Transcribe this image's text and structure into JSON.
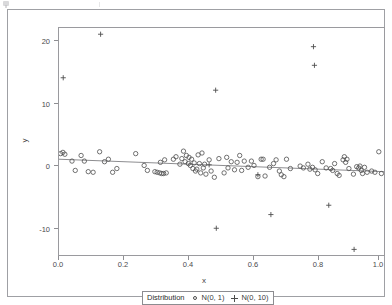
{
  "figure": {
    "background_color": "#ffffff",
    "border_color": "#9fa0a4",
    "marker_color": "#4d4d4d",
    "line_color": "#6f6f73"
  },
  "axis": {
    "x_label": "x",
    "y_label": "y",
    "x_ticks": [
      "0.0",
      "0.2",
      "0.4",
      "0.6",
      "0.8",
      "1.0"
    ],
    "y_ticks": [
      "20",
      "10",
      "0",
      "-10"
    ]
  },
  "legend": {
    "title": "Distribution",
    "entries": [
      {
        "symbol": "circle",
        "label": "N(0, 1)"
      },
      {
        "symbol": "plus",
        "label": "N(0, 10)"
      }
    ]
  },
  "chart_data": {
    "type": "scatter",
    "title": "",
    "subtitle": "",
    "xlabel": "x",
    "ylabel": "y",
    "xlim": [
      0.0,
      1.0
    ],
    "ylim": [
      -14.5,
      22.0
    ],
    "xticks": [
      0.0,
      0.2,
      0.4,
      0.6,
      0.8,
      1.0
    ],
    "yticks": [
      20,
      10,
      0,
      -10
    ],
    "grid": false,
    "legend_position": "bottom-center",
    "legend_title": "Distribution",
    "annotations": [],
    "series": [
      {
        "name": "N(0, 1)",
        "marker": "circle",
        "points": [
          [
            0.005,
            1.8
          ],
          [
            0.012,
            2.0
          ],
          [
            0.018,
            1.7
          ],
          [
            0.04,
            0.6
          ],
          [
            0.05,
            -0.9
          ],
          [
            0.068,
            1.5
          ],
          [
            0.078,
            0.6
          ],
          [
            0.09,
            -1.1
          ],
          [
            0.105,
            -1.2
          ],
          [
            0.125,
            2.1
          ],
          [
            0.14,
            0.5
          ],
          [
            0.152,
            0.9
          ],
          [
            0.165,
            -1.2
          ],
          [
            0.178,
            -0.6
          ],
          [
            0.236,
            1.8
          ],
          [
            0.262,
            -0.1
          ],
          [
            0.272,
            -0.9
          ],
          [
            0.295,
            -1.1
          ],
          [
            0.302,
            -1.2
          ],
          [
            0.31,
            -1.3
          ],
          [
            0.312,
            0.4
          ],
          [
            0.316,
            -1.4
          ],
          [
            0.322,
            -1.4
          ],
          [
            0.325,
            0.8
          ],
          [
            0.33,
            -1.3
          ],
          [
            0.352,
            0.9
          ],
          [
            0.36,
            1.3
          ],
          [
            0.372,
            0.1
          ],
          [
            0.378,
            1.0
          ],
          [
            0.383,
            2.2
          ],
          [
            0.388,
            0.5
          ],
          [
            0.392,
            1.5
          ],
          [
            0.398,
            0.2
          ],
          [
            0.4,
            1.2
          ],
          [
            0.404,
            -0.1
          ],
          [
            0.408,
            0.9
          ],
          [
            0.412,
            -0.6
          ],
          [
            0.416,
            0.3
          ],
          [
            0.42,
            -1.0
          ],
          [
            0.424,
            -0.7
          ],
          [
            0.428,
            1.6
          ],
          [
            0.432,
            0.2
          ],
          [
            0.436,
            -1.3
          ],
          [
            0.44,
            1.9
          ],
          [
            0.444,
            -0.5
          ],
          [
            0.448,
            0.1
          ],
          [
            0.452,
            -1.5
          ],
          [
            0.462,
            0.8
          ],
          [
            0.468,
            -1.0
          ],
          [
            0.478,
            -2.0
          ],
          [
            0.492,
            1.0
          ],
          [
            0.508,
            -1.3
          ],
          [
            0.516,
            1.2
          ],
          [
            0.52,
            -0.5
          ],
          [
            0.53,
            0.5
          ],
          [
            0.54,
            -0.8
          ],
          [
            0.548,
            0.4
          ],
          [
            0.556,
            1.5
          ],
          [
            0.562,
            -0.9
          ],
          [
            0.57,
            0.6
          ],
          [
            0.582,
            -0.4
          ],
          [
            0.592,
            0.6
          ],
          [
            0.6,
            -0.1
          ],
          [
            0.612,
            -1.9
          ],
          [
            0.622,
            0.9
          ],
          [
            0.628,
            0.9
          ],
          [
            0.634,
            -1.8
          ],
          [
            0.648,
            -0.4
          ],
          [
            0.66,
            0.2
          ],
          [
            0.668,
            0.8
          ],
          [
            0.678,
            -1.0
          ],
          [
            0.684,
            -1.6
          ],
          [
            0.692,
            -1.9
          ],
          [
            0.7,
            0.9
          ],
          [
            0.712,
            -0.6
          ],
          [
            0.742,
            -0.2
          ],
          [
            0.752,
            -0.5
          ],
          [
            0.766,
            0.1
          ],
          [
            0.772,
            -0.7
          ],
          [
            0.78,
            -0.4
          ],
          [
            0.788,
            -0.8
          ],
          [
            0.796,
            -1.4
          ],
          [
            0.81,
            0.5
          ],
          [
            0.822,
            -0.5
          ],
          [
            0.836,
            -0.6
          ],
          [
            0.842,
            -0.9
          ],
          [
            0.848,
            0.2
          ],
          [
            0.856,
            -1.4
          ],
          [
            0.862,
            -1.7
          ],
          [
            0.874,
            0.8
          ],
          [
            0.878,
            1.3
          ],
          [
            0.882,
            0.4
          ],
          [
            0.886,
            0.9
          ],
          [
            0.892,
            -0.6
          ],
          [
            0.906,
            -1.5
          ],
          [
            0.916,
            -0.3
          ],
          [
            0.922,
            -0.5
          ],
          [
            0.926,
            -0.2
          ],
          [
            0.93,
            -0.9
          ],
          [
            0.934,
            -1.4
          ],
          [
            0.94,
            -0.4
          ],
          [
            0.948,
            -1.2
          ],
          [
            0.962,
            -1.0
          ],
          [
            0.972,
            -1.2
          ],
          [
            0.984,
            2.1
          ],
          [
            0.992,
            -1.4
          ]
        ]
      },
      {
        "name": "N(0, 10)",
        "marker": "plus",
        "points": [
          [
            0.013,
            14.0
          ],
          [
            0.128,
            21.0
          ],
          [
            0.482,
            12.0
          ],
          [
            0.462,
            0.0
          ],
          [
            0.612,
            -1.6
          ],
          [
            0.783,
            19.0
          ],
          [
            0.786,
            16.0
          ],
          [
            0.484,
            -10.2
          ],
          [
            0.652,
            -8.0
          ],
          [
            0.83,
            -6.5
          ],
          [
            0.908,
            -13.6
          ]
        ]
      }
    ],
    "trend_line": {
      "name": "fit",
      "x": [
        0.0,
        1.0
      ],
      "y": [
        0.9,
        -1.1
      ]
    }
  }
}
